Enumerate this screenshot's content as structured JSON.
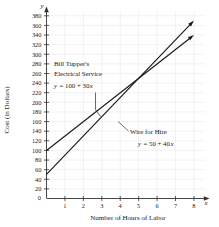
{
  "chart_data": {
    "type": "line",
    "title": "",
    "xlabel": "Number of Hours of Labor",
    "ylabel": "Cost (in Dollars)",
    "x_axis_variable": "x",
    "y_axis_variable": "y",
    "xlim": [
      0,
      8.6
    ],
    "ylim": [
      0,
      390
    ],
    "x_ticks": [
      "1",
      "2",
      "3",
      "4",
      "5",
      "6",
      "7",
      "8"
    ],
    "y_ticks": [
      "20",
      "40",
      "60",
      "80",
      "100",
      "120",
      "140",
      "160",
      "180",
      "200",
      "220",
      "240",
      "260",
      "280",
      "300",
      "320",
      "340",
      "360",
      "380"
    ],
    "origin_label": "0",
    "grid": true,
    "legend_position": "inline-annotations",
    "series": [
      {
        "name": "Bill Tupper's Electrical Service",
        "equation": "y = 100 + 30x",
        "intercept": 100,
        "slope": 30,
        "x": [
          0,
          8
        ],
        "values": [
          100,
          340
        ],
        "color": "#1a1a1a"
      },
      {
        "name": "Wire for Hire",
        "equation": "y = 50 + 40x",
        "intercept": 50,
        "slope": 40,
        "x": [
          0,
          8
        ],
        "values": [
          50,
          370
        ],
        "color": "#1a1a1a"
      }
    ],
    "intersection": {
      "x": 5,
      "y": 250
    },
    "annotations": [
      {
        "id": "bill-tupper",
        "line1": "Bill Tupper's",
        "line2": "Electrical Service",
        "equation_lhs": "y",
        "equation_rhs": "= 100 + 30",
        "equation_var": "x"
      },
      {
        "id": "wire-for-hire",
        "line1": "Wire for Hire",
        "equation_lhs": "y",
        "equation_rhs": "= 50 + 40",
        "equation_var": "x"
      }
    ]
  },
  "colors": {
    "axis": "#333333",
    "grid": "#e9e9ec",
    "line": "#1a1a1a",
    "text": "#1a1a1a",
    "background": "#ffffff"
  }
}
